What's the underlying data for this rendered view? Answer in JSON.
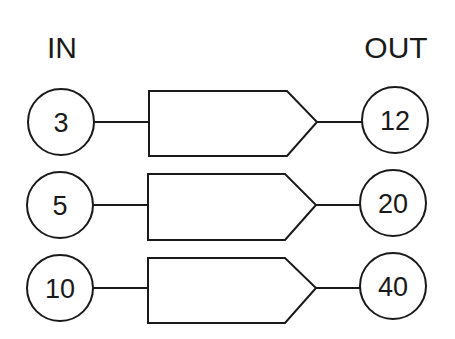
{
  "diagram": {
    "headers": {
      "input": "IN",
      "output": "OUT"
    },
    "rows": [
      {
        "input": "3",
        "output": "12"
      },
      {
        "input": "5",
        "output": "20"
      },
      {
        "input": "10",
        "output": "40"
      }
    ],
    "colors": {
      "stroke": "#1a1a1a",
      "background": "#ffffff"
    }
  }
}
